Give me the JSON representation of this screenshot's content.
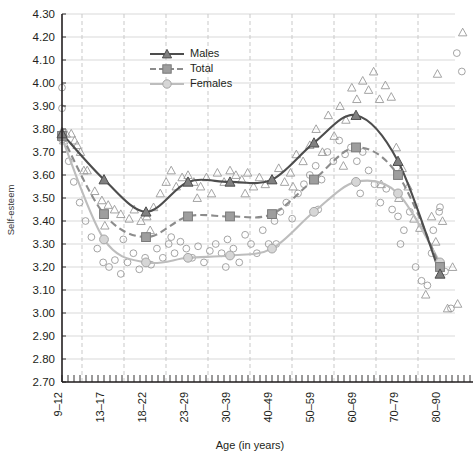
{
  "chart_data": {
    "type": "line",
    "title": "",
    "xlabel": "Age (in years)",
    "ylabel": "Self-esteem",
    "categories": [
      "9–12",
      "13–17",
      "18–22",
      "23–29",
      "30–39",
      "40–49",
      "50–59",
      "60–69",
      "70–79",
      "80–90"
    ],
    "ylim": [
      2.7,
      4.3
    ],
    "ytick_labels": [
      "4.30",
      "4.20",
      "4.10",
      "4.00",
      "3.90",
      "3.80",
      "3.70",
      "3.60",
      "3.50",
      "3.40",
      "3.30",
      "3.20",
      "3.10",
      "3.00",
      "2.90",
      "2.80",
      "2.70"
    ],
    "ytick_step": 0.1,
    "grid": "horizontal-solid + vertical-dashed",
    "legend_position": "top-center",
    "series": [
      {
        "name": "Males",
        "marker": "triangle",
        "line": "solid",
        "color": "#4d4d4d",
        "values": [
          3.78,
          3.58,
          3.44,
          3.57,
          3.57,
          3.58,
          3.74,
          3.86,
          3.66,
          3.17
        ]
      },
      {
        "name": "Total",
        "marker": "square",
        "line": "dashed",
        "color": "#8c8c8c",
        "values": [
          3.77,
          3.43,
          3.33,
          3.42,
          3.42,
          3.43,
          3.58,
          3.72,
          3.6,
          3.2
        ]
      },
      {
        "name": "Females",
        "marker": "circle",
        "line": "solid",
        "color": "#bdbdbd",
        "values": [
          3.76,
          3.32,
          3.22,
          3.24,
          3.25,
          3.28,
          3.44,
          3.57,
          3.52,
          3.22
        ]
      }
    ],
    "scatter_triangles": [
      [
        0.0,
        3.79
      ],
      [
        0.04,
        3.75
      ],
      [
        0.1,
        3.78
      ],
      [
        0.22,
        3.78
      ],
      [
        0.3,
        3.75
      ],
      [
        0.36,
        3.73
      ],
      [
        0.44,
        3.7
      ],
      [
        0.6,
        3.62
      ],
      [
        0.78,
        3.53
      ],
      [
        0.95,
        3.49
      ],
      [
        1.1,
        3.47
      ],
      [
        1.25,
        3.45
      ],
      [
        1.4,
        3.43
      ],
      [
        1.6,
        3.41
      ],
      [
        1.72,
        3.45
      ],
      [
        1.88,
        3.4
      ],
      [
        2.02,
        3.42
      ],
      [
        2.18,
        3.46
      ],
      [
        2.34,
        3.52
      ],
      [
        2.48,
        3.57
      ],
      [
        2.6,
        3.62
      ],
      [
        2.72,
        3.55
      ],
      [
        2.86,
        3.59
      ],
      [
        3.0,
        3.6
      ],
      [
        3.14,
        3.57
      ],
      [
        3.3,
        3.55
      ],
      [
        3.44,
        3.59
      ],
      [
        3.56,
        3.52
      ],
      [
        3.7,
        3.61
      ],
      [
        3.86,
        3.57
      ],
      [
        4.0,
        3.62
      ],
      [
        4.14,
        3.6
      ],
      [
        4.28,
        3.58
      ],
      [
        4.42,
        3.61
      ],
      [
        4.56,
        3.55
      ],
      [
        4.7,
        3.59
      ],
      [
        4.84,
        3.56
      ],
      [
        5.0,
        3.58
      ],
      [
        5.16,
        3.63
      ],
      [
        5.3,
        3.57
      ],
      [
        5.44,
        3.61
      ],
      [
        5.58,
        3.69
      ],
      [
        5.74,
        3.66
      ],
      [
        5.9,
        3.73
      ],
      [
        6.05,
        3.8
      ],
      [
        6.2,
        3.7
      ],
      [
        6.34,
        3.86
      ],
      [
        6.48,
        3.77
      ],
      [
        6.62,
        3.9
      ],
      [
        6.76,
        3.84
      ],
      [
        6.9,
        3.98
      ],
      [
        7.02,
        3.93
      ],
      [
        7.16,
        4.01
      ],
      [
        7.3,
        3.97
      ],
      [
        7.42,
        4.05
      ],
      [
        7.56,
        3.93
      ],
      [
        7.7,
        3.99
      ],
      [
        7.84,
        3.94
      ],
      [
        7.96,
        3.72
      ],
      [
        8.1,
        3.63
      ],
      [
        8.24,
        3.55
      ],
      [
        8.38,
        3.41
      ],
      [
        8.52,
        3.37
      ],
      [
        8.66,
        3.08
      ],
      [
        8.8,
        3.42
      ],
      [
        8.94,
        4.04
      ],
      [
        9.06,
        3.4
      ],
      [
        9.18,
        3.02
      ],
      [
        9.3,
        3.2
      ],
      [
        9.42,
        3.04
      ],
      [
        9.54,
        4.22
      ],
      [
        0.52,
        3.62
      ],
      [
        1.02,
        3.38
      ],
      [
        2.1,
        3.36
      ],
      [
        3.22,
        3.5
      ],
      [
        4.36,
        3.52
      ],
      [
        5.5,
        3.55
      ],
      [
        6.7,
        3.64
      ],
      [
        7.6,
        3.56
      ],
      [
        8.02,
        3.5
      ],
      [
        8.9,
        3.31
      ]
    ],
    "scatter_circles": [
      [
        0.0,
        3.98
      ],
      [
        0.0,
        3.89
      ],
      [
        0.02,
        3.76
      ],
      [
        0.16,
        3.66
      ],
      [
        0.28,
        3.57
      ],
      [
        0.42,
        3.48
      ],
      [
        0.56,
        3.4
      ],
      [
        0.7,
        3.33
      ],
      [
        0.84,
        3.28
      ],
      [
        0.98,
        3.22
      ],
      [
        1.12,
        3.2
      ],
      [
        1.26,
        3.23
      ],
      [
        1.4,
        3.17
      ],
      [
        1.56,
        3.22
      ],
      [
        1.7,
        3.26
      ],
      [
        1.84,
        3.19
      ],
      [
        1.98,
        3.24
      ],
      [
        2.12,
        3.21
      ],
      [
        2.26,
        3.28
      ],
      [
        2.4,
        3.24
      ],
      [
        2.54,
        3.3
      ],
      [
        2.68,
        3.26
      ],
      [
        2.82,
        3.31
      ],
      [
        2.96,
        3.28
      ],
      [
        3.1,
        3.24
      ],
      [
        3.24,
        3.29
      ],
      [
        3.38,
        3.22
      ],
      [
        3.52,
        3.27
      ],
      [
        3.66,
        3.3
      ],
      [
        3.8,
        3.26
      ],
      [
        3.94,
        3.32
      ],
      [
        4.08,
        3.28
      ],
      [
        4.22,
        3.22
      ],
      [
        4.36,
        3.34
      ],
      [
        4.5,
        3.3
      ],
      [
        4.64,
        3.26
      ],
      [
        4.78,
        3.36
      ],
      [
        4.92,
        3.3
      ],
      [
        5.06,
        3.4
      ],
      [
        5.2,
        3.44
      ],
      [
        5.34,
        3.48
      ],
      [
        5.48,
        3.41
      ],
      [
        5.62,
        3.52
      ],
      [
        5.76,
        3.56
      ],
      [
        5.9,
        3.6
      ],
      [
        6.04,
        3.64
      ],
      [
        6.18,
        3.58
      ],
      [
        6.32,
        3.7
      ],
      [
        6.46,
        3.66
      ],
      [
        6.6,
        3.75
      ],
      [
        6.74,
        3.69
      ],
      [
        6.88,
        3.72
      ],
      [
        7.02,
        3.66
      ],
      [
        7.16,
        3.7
      ],
      [
        7.3,
        3.62
      ],
      [
        7.44,
        3.56
      ],
      [
        7.58,
        3.48
      ],
      [
        7.72,
        3.54
      ],
      [
        7.86,
        3.45
      ],
      [
        8.0,
        3.42
      ],
      [
        8.14,
        3.36
      ],
      [
        8.28,
        3.44
      ],
      [
        8.42,
        3.2
      ],
      [
        8.56,
        3.14
      ],
      [
        8.7,
        3.12
      ],
      [
        8.84,
        3.36
      ],
      [
        8.98,
        3.44
      ],
      [
        9.12,
        3.18
      ],
      [
        9.26,
        3.02
      ],
      [
        9.4,
        4.13
      ],
      [
        9.52,
        4.05
      ],
      [
        1.46,
        3.32
      ],
      [
        2.6,
        3.33
      ],
      [
        3.9,
        3.2
      ],
      [
        5.1,
        3.3
      ],
      [
        6.1,
        3.45
      ],
      [
        7.1,
        3.52
      ],
      [
        8.06,
        3.3
      ],
      [
        8.8,
        3.26
      ],
      [
        9.0,
        3.46
      ]
    ]
  },
  "legend": {
    "items": [
      {
        "label": "Males",
        "color": "#4d4d4d",
        "marker": "triangle",
        "line": "solid"
      },
      {
        "label": "Total",
        "color": "#8c8c8c",
        "marker": "square",
        "line": "dashed"
      },
      {
        "label": "Females",
        "color": "#bdbdbd",
        "marker": "circle",
        "line": "solid"
      }
    ]
  }
}
